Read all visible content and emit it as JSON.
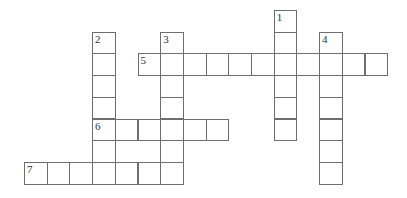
{
  "puzzle": {
    "type": "crossword",
    "grid_origin": {
      "x": 24,
      "y": 10
    },
    "cell_w": 22.7,
    "cell_h": 21.7,
    "border_color": "#6e6e6e",
    "entries": [
      {
        "number": "1",
        "direction": "down",
        "row": 0,
        "col": 11,
        "length": 6
      },
      {
        "number": "2",
        "direction": "down",
        "row": 1,
        "col": 3,
        "length": 7
      },
      {
        "number": "3",
        "direction": "down",
        "row": 1,
        "col": 6,
        "length": 7
      },
      {
        "number": "4",
        "direction": "down",
        "row": 1,
        "col": 13,
        "length": 7
      },
      {
        "number": "5",
        "direction": "across",
        "row": 2,
        "col": 5,
        "length": 11
      },
      {
        "number": "6",
        "direction": "across",
        "row": 5,
        "col": 3,
        "length": 6
      },
      {
        "number": "7",
        "direction": "across",
        "row": 7,
        "col": 0,
        "length": 7
      }
    ]
  }
}
